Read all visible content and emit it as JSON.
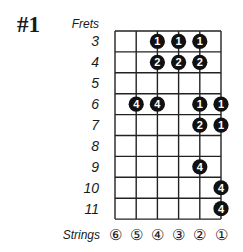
{
  "title": "#1",
  "frets_label": "Frets",
  "strings_label": "Strings",
  "frets": [
    "3",
    "4",
    "5",
    "6",
    "7",
    "8",
    "9",
    "10",
    "11"
  ],
  "strings": [
    "⑥",
    "⑤",
    "④",
    "③",
    "②",
    "①"
  ],
  "grid": {
    "left": 115,
    "top": 31,
    "col_width": 21.2,
    "row_height": 20.9,
    "num_strings": 6,
    "num_rows": 9,
    "line_color": "#222222",
    "dot_color": "#111111",
    "dot_text_color": "#ffffff"
  },
  "dots": [
    {
      "fret": "3",
      "string": 4,
      "finger": "1"
    },
    {
      "fret": "3",
      "string": 3,
      "finger": "1"
    },
    {
      "fret": "3",
      "string": 2,
      "finger": "1"
    },
    {
      "fret": "4",
      "string": 4,
      "finger": "2"
    },
    {
      "fret": "4",
      "string": 3,
      "finger": "2"
    },
    {
      "fret": "4",
      "string": 2,
      "finger": "2"
    },
    {
      "fret": "6",
      "string": 5,
      "finger": "4"
    },
    {
      "fret": "6",
      "string": 4,
      "finger": "4"
    },
    {
      "fret": "6",
      "string": 2,
      "finger": "1"
    },
    {
      "fret": "6",
      "string": 1,
      "finger": "1"
    },
    {
      "fret": "7",
      "string": 2,
      "finger": "2"
    },
    {
      "fret": "7",
      "string": 1,
      "finger": "1"
    },
    {
      "fret": "9",
      "string": 2,
      "finger": "4"
    },
    {
      "fret": "10",
      "string": 1,
      "finger": "4"
    },
    {
      "fret": "11",
      "string": 1,
      "finger": "4"
    }
  ]
}
